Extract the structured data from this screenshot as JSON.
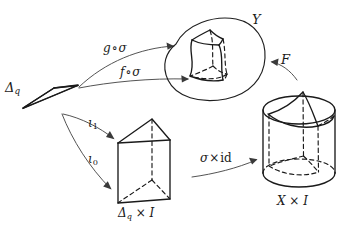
{
  "figure": {
    "background_color": "#ffffff",
    "ink_color": "#1a1a1a"
  },
  "objects": [
    {
      "id": "simplex",
      "name": "q-simplex triangle",
      "label_main": "Δ",
      "label_sub": "q",
      "shape": "triangle"
    },
    {
      "id": "prism",
      "name": "prism over simplex",
      "label": "Δ",
      "label_sub": "q",
      "label_rest": " × I",
      "shape": "triangular-prism"
    },
    {
      "id": "blob",
      "name": "space Y with embedded curved prism",
      "label": "Y",
      "shape": "blob"
    },
    {
      "id": "cylinder",
      "name": "cylinder X cross I",
      "label": "X × I",
      "shape": "cylinder"
    }
  ],
  "arrows": [
    {
      "id": "g-sigma",
      "name": "g-compose-sigma-arrow",
      "label_fn": "g",
      "label_op": "∘",
      "label_arg": "σ",
      "label_full": "g ∘ σ",
      "from": "simplex",
      "to": "blob"
    },
    {
      "id": "f-sigma",
      "name": "f-compose-sigma-arrow",
      "label_fn": "f",
      "label_op": "∘",
      "label_arg": "σ",
      "label_full": "f ∘ σ",
      "from": "simplex",
      "to": "blob"
    },
    {
      "id": "iota1",
      "name": "iota-one-arrow",
      "label_main": "ι",
      "label_sub": "1",
      "label_full": "ι₁",
      "from": "simplex",
      "to": "prism"
    },
    {
      "id": "iota0",
      "name": "iota-zero-arrow",
      "label_main": "ι",
      "label_sub": "0",
      "label_full": "ι₀",
      "from": "simplex",
      "to": "prism"
    },
    {
      "id": "sigma-times-id",
      "name": "sigma-cross-id-arrow",
      "label_main": "σ",
      "label_times": "×",
      "label_id": "id",
      "label_full": "σ × id",
      "from": "prism",
      "to": "cylinder"
    },
    {
      "id": "F",
      "name": "homotopy-F-arrow",
      "label": "F",
      "from": "cylinder",
      "to": "blob"
    }
  ],
  "labels": {
    "simplex": {
      "main": "Δ",
      "sub": "q"
    },
    "prism": {
      "main": "Δ",
      "sub": "q",
      "rest": " × I"
    },
    "blob": {
      "text": "Y"
    },
    "cylinder": {
      "text": "X × I"
    },
    "g_sigma": {
      "fn": "g",
      "op": "∘",
      "arg": "σ"
    },
    "f_sigma": {
      "fn": "f",
      "op": "∘",
      "arg": "σ"
    },
    "iota1": {
      "main": "ι",
      "sub": "1"
    },
    "iota0": {
      "main": "ι",
      "sub": "0"
    },
    "sigma_id": {
      "main": "σ",
      "times": "×",
      "id": "id"
    },
    "F": {
      "text": "F"
    }
  }
}
